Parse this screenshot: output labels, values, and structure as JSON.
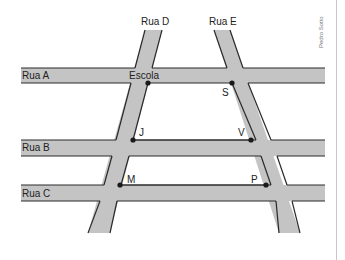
{
  "map": {
    "streets": {
      "rua_a": "Rua A",
      "rua_b": "Rua B",
      "rua_c": "Rua C",
      "rua_d": "Rua D",
      "rua_e": "Rua E"
    },
    "points": {
      "escola": "Escola",
      "s": "S",
      "j": "J",
      "v": "V",
      "m": "M",
      "p": "P"
    },
    "credit": "Pedro Sotto",
    "colors": {
      "street_fill": "#c4c4c4",
      "street_edge": "#2a2a2a",
      "point": "#1a1a1a",
      "background": "#ffffff"
    }
  }
}
